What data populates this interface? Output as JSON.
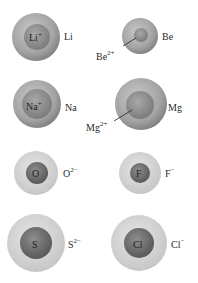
{
  "colors": {
    "outer_light": "#d4d4d4",
    "outer_dark": "#8a8a8a",
    "inner_light": "#9a9a9a",
    "inner_dark": "#5a5a5a",
    "text": "#2a2a2a"
  },
  "pairs": [
    {
      "atom": "Li",
      "ion_base": "Li",
      "ion_charge": "+",
      "ion_label_position": "inside",
      "ion_color": "dark-inner"
    },
    {
      "atom": "Be",
      "ion_base": "Be",
      "ion_charge": "2+",
      "ion_label_position": "leader-line",
      "ion_color": "dark-inner"
    },
    {
      "atom": "Na",
      "ion_base": "Na",
      "ion_charge": "+",
      "ion_label_position": "inside",
      "ion_color": "dark-inner"
    },
    {
      "atom": "Mg",
      "ion_base": "Mg",
      "ion_charge": "2+",
      "ion_label_position": "leader-line",
      "ion_color": "dark-inner"
    },
    {
      "atom": "O",
      "ion_base": "O",
      "ion_charge": "2−",
      "ion_label_position": "outside",
      "ion_color": "light-outer"
    },
    {
      "atom": "F",
      "ion_base": "F",
      "ion_charge": "−",
      "ion_label_position": "outside",
      "ion_color": "light-outer"
    },
    {
      "atom": "S",
      "ion_base": "S",
      "ion_charge": "2−",
      "ion_label_position": "outside",
      "ion_color": "light-outer"
    },
    {
      "atom": "Cl",
      "ion_base": "Cl",
      "ion_charge": "−",
      "ion_label_position": "outside",
      "ion_color": "light-outer"
    }
  ]
}
